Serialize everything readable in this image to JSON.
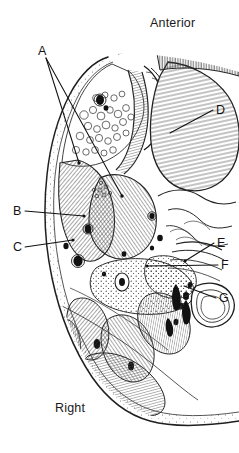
{
  "figure": {
    "kind": "anatomical-cross-section-line-drawing",
    "background_color": "#ffffff",
    "ink_color": "#1a1a1a",
    "width": 239,
    "height": 453
  },
  "orientation": {
    "anterior_label": "Anterior",
    "right_label": "Right"
  },
  "callouts": [
    {
      "id": "A",
      "label": "A",
      "x": 38,
      "y": 44
    },
    {
      "id": "B",
      "label": "B",
      "x": 13,
      "y": 204
    },
    {
      "id": "C",
      "label": "C",
      "x": 13,
      "y": 240
    },
    {
      "id": "D",
      "label": "D",
      "x": 216,
      "y": 103
    },
    {
      "id": "E",
      "label": "E",
      "x": 217,
      "y": 236
    },
    {
      "id": "F",
      "label": "F",
      "x": 221,
      "y": 258
    },
    {
      "id": "G",
      "label": "G",
      "x": 219,
      "y": 291
    }
  ],
  "leader_lines": [
    {
      "from": "A",
      "path": "M 46 58 L 79 163"
    },
    {
      "from": "A",
      "path": "M 46 58 L 122 196"
    },
    {
      "from": "B",
      "path": "M 25 211 L 84 216"
    },
    {
      "from": "C",
      "path": "M 25 247 L 73 240"
    },
    {
      "from": "D",
      "path": "M 213 110 L 170 133"
    },
    {
      "from": "E",
      "path": "M 214 243 L 185 261"
    },
    {
      "from": "F",
      "path": "M 218 265 L 147 266"
    },
    {
      "from": "G",
      "path": "M 216 298 L 184 286"
    }
  ]
}
